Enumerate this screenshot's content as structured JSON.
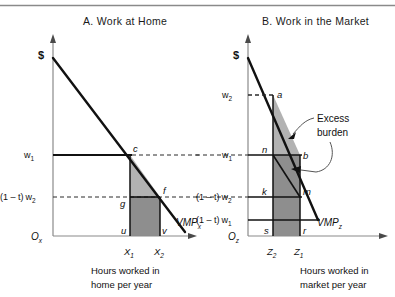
{
  "figure": {
    "top_rule": true,
    "panels": [
      {
        "id": "A",
        "title": "A.  Work at Home",
        "money_axis_label": "$",
        "origin_label": "O",
        "origin_sub": "x",
        "curve_label": "VMP",
        "curve_sub": "x",
        "caption_line1": "Hours worked in",
        "caption_line2": "home per year",
        "wage_labels": [
          {
            "id": "w1",
            "text": "w",
            "sub": "1",
            "prefix": ""
          },
          {
            "id": "1mt_w2",
            "text": "w",
            "sub": "2",
            "prefix": "(1 – t)"
          }
        ],
        "x_ticks": [
          {
            "text": "X",
            "sub": "1"
          },
          {
            "text": "X",
            "sub": "2"
          }
        ],
        "point_labels": [
          "c",
          "f",
          "g",
          "u",
          "v"
        ]
      },
      {
        "id": "B",
        "title": "B.  Work in the Market",
        "money_axis_label": "$",
        "origin_label": "O",
        "origin_sub": "z",
        "curve_label": "VMP",
        "curve_sub": "z",
        "caption_line1": "Hours worked in",
        "caption_line2": "market per year",
        "wage_labels": [
          {
            "id": "w2",
            "text": "w",
            "sub": "2",
            "prefix": ""
          },
          {
            "id": "w1",
            "text": "w",
            "sub": "1",
            "prefix": ""
          },
          {
            "id": "1mt_w2",
            "text": "w",
            "sub": "2",
            "prefix": "(1 – t)"
          },
          {
            "id": "1mt_w1",
            "text": "w",
            "sub": "1",
            "prefix": "(1 – t)"
          }
        ],
        "x_ticks": [
          {
            "text": "Z",
            "sub": "2"
          },
          {
            "text": "Z",
            "sub": "1"
          }
        ],
        "point_labels": [
          "a",
          "n",
          "b",
          "k",
          "m",
          "s",
          "r"
        ],
        "annotation": {
          "line1": "Excess",
          "line2": "burden"
        }
      }
    ],
    "colors": {
      "line": "#111111",
      "axis": "#6b6b6b",
      "shade_light": "#b9b9b9",
      "shade_dark": "#8e8e8e",
      "dashed": "#2a2a2a",
      "background": "#ffffff"
    }
  }
}
